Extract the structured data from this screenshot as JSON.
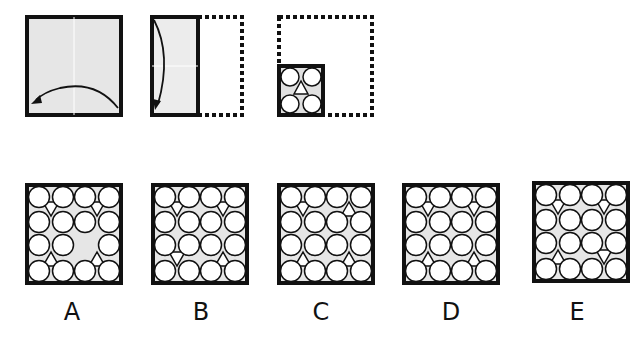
{
  "colors": {
    "paper": "#e6e6e6",
    "stroke": "#111111",
    "hole": "#ffffff"
  },
  "steps": [
    {
      "name": "fold-right-to-left",
      "fold": "horizontal-half",
      "arrow": "right-to-left"
    },
    {
      "name": "fold-top-to-bottom",
      "fold": "vertical-half",
      "arrow": "top-to-bottom"
    },
    {
      "name": "punch",
      "holes": [
        {
          "shape": "circle",
          "pos": "top-left"
        },
        {
          "shape": "circle",
          "pos": "top-right"
        },
        {
          "shape": "triangle-up",
          "pos": "center"
        },
        {
          "shape": "circle",
          "pos": "bottom-left"
        },
        {
          "shape": "circle",
          "pos": "bottom-right"
        }
      ]
    }
  ],
  "options": [
    {
      "label": "A",
      "circles": [
        [
          1,
          1,
          1,
          1
        ],
        [
          1,
          1,
          1,
          1
        ],
        [
          1,
          1,
          0,
          1
        ],
        [
          1,
          1,
          1,
          1
        ]
      ],
      "triangles": [
        {
          "col": "left",
          "row": "top",
          "dir": "down"
        },
        {
          "col": "right",
          "row": "top",
          "dir": "down"
        },
        {
          "col": "left",
          "row": "bottom",
          "dir": "up"
        },
        {
          "col": "right",
          "row": "bottom",
          "dir": "up"
        }
      ]
    },
    {
      "label": "B",
      "circles": [
        [
          1,
          1,
          1,
          1
        ],
        [
          1,
          1,
          1,
          1
        ],
        [
          1,
          1,
          1,
          1
        ],
        [
          1,
          1,
          1,
          1
        ]
      ],
      "triangles": [
        {
          "col": "left",
          "row": "top",
          "dir": "down"
        },
        {
          "col": "right",
          "row": "top",
          "dir": "down"
        },
        {
          "col": "left",
          "row": "bottom",
          "dir": "down"
        },
        {
          "col": "right",
          "row": "bottom",
          "dir": "up"
        }
      ]
    },
    {
      "label": "C",
      "circles": [
        [
          1,
          1,
          1,
          1
        ],
        [
          1,
          1,
          1,
          1
        ],
        [
          1,
          1,
          1,
          1
        ],
        [
          1,
          1,
          1,
          1
        ]
      ],
      "triangles": [
        {
          "col": "left",
          "row": "top",
          "dir": "down"
        },
        {
          "col": "right",
          "row": "top",
          "dir": "up"
        },
        {
          "col": "left",
          "row": "bottom",
          "dir": "up"
        },
        {
          "col": "right",
          "row": "bottom",
          "dir": "up"
        }
      ]
    },
    {
      "label": "D",
      "circles": [
        [
          1,
          1,
          1,
          1
        ],
        [
          1,
          1,
          1,
          1
        ],
        [
          1,
          1,
          1,
          1
        ],
        [
          1,
          1,
          1,
          1
        ]
      ],
      "triangles": [
        {
          "col": "left",
          "row": "top",
          "dir": "down"
        },
        {
          "col": "right",
          "row": "top",
          "dir": "down"
        },
        {
          "col": "left",
          "row": "bottom",
          "dir": "up"
        },
        {
          "col": "right",
          "row": "bottom",
          "dir": "up"
        }
      ]
    },
    {
      "label": "E",
      "circles": [
        [
          1,
          1,
          1,
          1
        ],
        [
          1,
          1,
          1,
          1
        ],
        [
          1,
          1,
          1,
          1
        ],
        [
          1,
          1,
          1,
          1
        ]
      ],
      "triangles": [
        {
          "col": "left",
          "row": "top",
          "dir": "down"
        },
        {
          "col": "right",
          "row": "top",
          "dir": "down"
        },
        {
          "col": "left",
          "row": "bottom",
          "dir": "up"
        },
        {
          "col": "right",
          "row": "bottom",
          "dir": "down"
        }
      ]
    }
  ]
}
